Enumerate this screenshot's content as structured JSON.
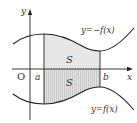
{
  "diagram": {
    "axes": {
      "x_label": "x",
      "y_label": "y",
      "origin_label": "O"
    },
    "bounds": {
      "a_label": "a",
      "b_label": "b"
    },
    "curves": {
      "upper_label": "y=−f(x)",
      "lower_label": "y=f(x)"
    },
    "regions": {
      "upper_area_label": "S",
      "lower_area_label": "S"
    },
    "colors": {
      "shade_upper": "#e4e4e4",
      "shade_lower": "#d6d6d6",
      "stroke": "#222222"
    }
  }
}
